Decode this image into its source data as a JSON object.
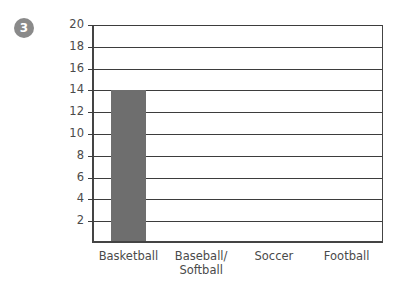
{
  "badge": {
    "label": "3",
    "color": "#8a8a8a",
    "text_color": "#ffffff"
  },
  "chart_data": {
    "type": "bar",
    "title": "",
    "xlabel": "",
    "ylabel": "",
    "categories": [
      "Basketball",
      "Baseball/\nSoftball",
      "Soccer",
      "Football"
    ],
    "values": [
      14,
      0,
      0,
      0
    ],
    "ylim": [
      0,
      20
    ],
    "ytick_step": 2,
    "yticks": [
      20,
      18,
      16,
      14,
      12,
      10,
      8,
      6,
      4,
      2
    ],
    "ytick_labels": [
      "20",
      "18",
      "16",
      "14",
      "12",
      "10",
      "8",
      "6",
      "4",
      "2"
    ],
    "grid": true,
    "grid_axis": "y",
    "legend": false,
    "bar_color": "#6e6e6e",
    "axis_color": "#3d3d3d",
    "bar_width_fraction": 0.48
  }
}
